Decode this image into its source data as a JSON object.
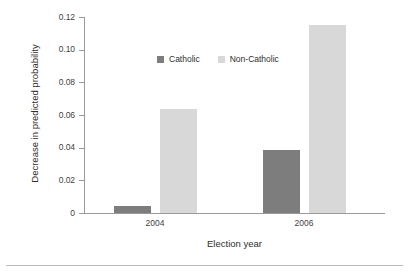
{
  "chart_data": {
    "type": "bar",
    "title": "",
    "subtitle": "",
    "xlabel": "Election year",
    "ylabel": "Decrease in predicted probability",
    "categories": [
      "2004",
      "2006"
    ],
    "series": [
      {
        "name": "Catholic",
        "values": [
          0.004,
          0.0385
        ],
        "color": "#7d7d7d"
      },
      {
        "name": "Non-Catholic",
        "values": [
          0.0635,
          0.115
        ],
        "color": "#d8d8d8"
      }
    ],
    "ylim": [
      0,
      0.12
    ],
    "yticks": [
      0,
      0.02,
      0.04,
      0.06,
      0.08,
      0.1,
      0.12
    ],
    "ytick_labels": [
      "0",
      "0.02",
      "0.04",
      "0.06",
      "0.08",
      "0.10",
      "0.12"
    ],
    "grid": false,
    "legend_position": "upper-center"
  },
  "axes": {
    "y_title": "Decrease in predicted probability",
    "x_title": "Election year",
    "y_tick_labels": [
      "0.12",
      "0.10",
      "0.08",
      "0.06",
      "0.04",
      "0.02",
      "0"
    ],
    "x_tick_labels": [
      "2004",
      "2006"
    ]
  },
  "legend": {
    "items": [
      {
        "label": "Catholic",
        "color": "#7d7d7d"
      },
      {
        "label": "Non-Catholic",
        "color": "#d8d8d8"
      }
    ]
  },
  "colors": {
    "catholic": "#7d7d7d",
    "non_catholic": "#d8d8d8",
    "axis": "#9a9a9a",
    "text": "#2e2e2e",
    "background": "#ffffff",
    "rule": "#b9b9b9"
  }
}
